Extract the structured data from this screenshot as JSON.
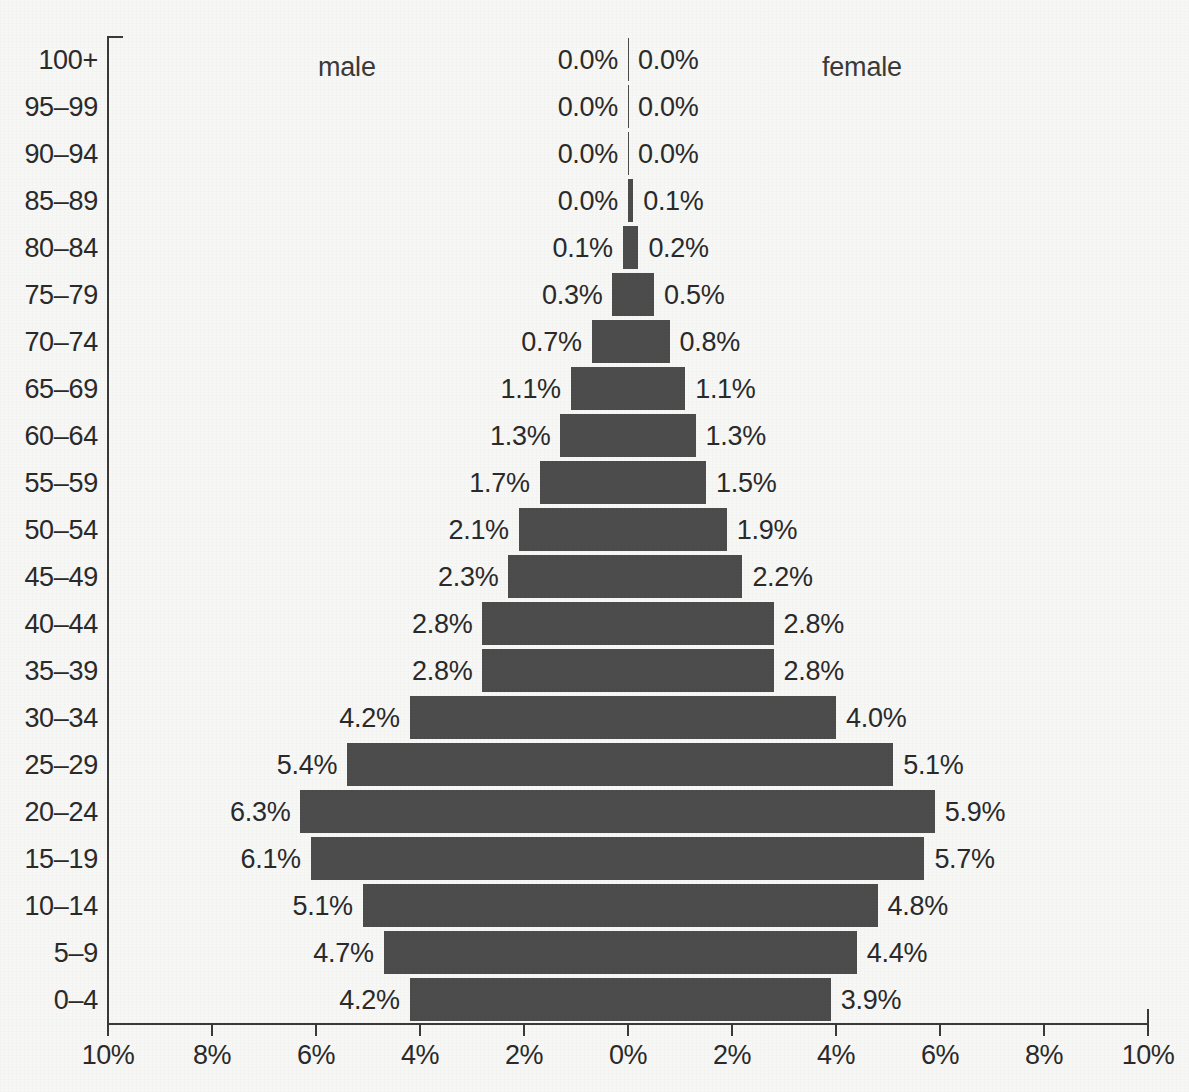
{
  "captions": {
    "male": "male",
    "female": "female"
  },
  "axis": {
    "x_tick_labels": [
      "10%",
      "8%",
      "6%",
      "4%",
      "2%",
      "0%",
      "2%",
      "4%",
      "6%",
      "8%",
      "10%"
    ],
    "x_tick_values": [
      -10,
      -8,
      -6,
      -4,
      -2,
      0,
      2,
      4,
      6,
      8,
      10
    ],
    "x_min": -10,
    "x_max": 10,
    "center_px": 628,
    "px_per_percent": 52,
    "axis_top_px": 36,
    "axis_bottom_px": 1023
  },
  "colors": {
    "bar": "#4c4c4c",
    "background": "#f7f7f5",
    "axis": "#3a3a3a",
    "text": "#2a2a2a"
  },
  "chart_data": {
    "type": "bar",
    "title": "",
    "subtitle": "",
    "xlabel": "",
    "ylabel": "",
    "xlim": [
      -10,
      10
    ],
    "grid": false,
    "legend_position": "top-inline",
    "orientation": "horizontal-diverging",
    "categories": [
      "100+",
      "95–99",
      "90–94",
      "85–89",
      "80–84",
      "75–79",
      "70–74",
      "65–69",
      "60–64",
      "55–59",
      "50–54",
      "45–49",
      "40–44",
      "35–39",
      "30–34",
      "25–29",
      "20–24",
      "15–19",
      "10–14",
      "5–9",
      "0–4"
    ],
    "series": [
      {
        "name": "male",
        "side": "left",
        "values": [
          0.0,
          0.0,
          0.0,
          0.0,
          0.1,
          0.3,
          0.7,
          1.1,
          1.3,
          1.7,
          2.1,
          2.3,
          2.8,
          2.8,
          4.2,
          5.4,
          6.3,
          6.1,
          5.1,
          4.7,
          4.2
        ],
        "labels": [
          "0.0%",
          "0.0%",
          "0.0%",
          "0.0%",
          "0.1%",
          "0.3%",
          "0.7%",
          "1.1%",
          "1.3%",
          "1.7%",
          "2.1%",
          "2.3%",
          "2.8%",
          "2.8%",
          "4.2%",
          "5.4%",
          "6.3%",
          "6.1%",
          "5.1%",
          "4.7%",
          "4.2%"
        ]
      },
      {
        "name": "female",
        "side": "right",
        "values": [
          0.0,
          0.0,
          0.0,
          0.1,
          0.2,
          0.5,
          0.8,
          1.1,
          1.3,
          1.5,
          1.9,
          2.2,
          2.8,
          2.8,
          4.0,
          5.1,
          5.9,
          5.7,
          4.8,
          4.4,
          3.9
        ],
        "labels": [
          "0.0%",
          "0.0%",
          "0.0%",
          "0.1%",
          "0.2%",
          "0.5%",
          "0.8%",
          "1.1%",
          "1.3%",
          "1.5%",
          "1.9%",
          "2.2%",
          "2.8%",
          "2.8%",
          "4.0%",
          "5.1%",
          "5.9%",
          "5.7%",
          "4.8%",
          "4.4%",
          "3.9%"
        ]
      }
    ]
  }
}
